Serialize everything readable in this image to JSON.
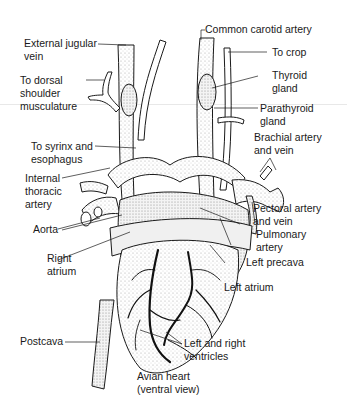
{
  "figure": {
    "title_line1": "Avian heart",
    "title_line2": "(ventral view)"
  },
  "labels": {
    "common_carotid_artery": "Common carotid artery",
    "external_jugular_vein_1": "External jugular",
    "external_jugular_vein_2": "vein",
    "to_crop": "To crop",
    "thyroid_gland_1": "Thyroid",
    "thyroid_gland_2": "gland",
    "to_dorsal_1": "To dorsal",
    "to_dorsal_2": "shoulder",
    "to_dorsal_3": "musculature",
    "parathyroid_gland_1": "Parathyroid",
    "parathyroid_gland_2": "gland",
    "to_syrinx_1": "To syrinx and",
    "to_syrinx_2": "esophagus",
    "brachial_1": "Brachial artery",
    "brachial_2": "and vein",
    "internal_thoracic_1": "Internal",
    "internal_thoracic_2": "thoracic",
    "internal_thoracic_3": "artery",
    "pectoral_1": "Pectoral artery",
    "pectoral_2": "and vein",
    "aorta": "Aorta",
    "pulmonary_1": "Pulmonary",
    "pulmonary_2": "artery",
    "right_atrium_1": "Right",
    "right_atrium_2": "atrium",
    "left_precava": "Left precava",
    "left_atrium": "Left atrium",
    "postcava": "Postcava",
    "ventricles_1": "Left and right",
    "ventricles_2": "ventricles"
  },
  "colors": {
    "ink": "#1a1a1a",
    "background": "#ffffff",
    "shade": "#d9d9d9"
  }
}
